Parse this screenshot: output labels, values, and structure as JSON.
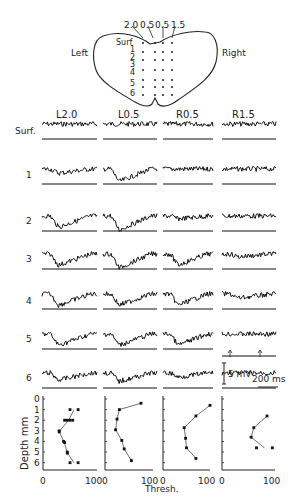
{
  "schematic": {
    "left_label": "Left",
    "right_label": "Right",
    "electrode_labels": [
      "2.0",
      "0.5",
      "0.5",
      "1.5"
    ],
    "depth_labels": [
      "Surf",
      "1",
      "2",
      "3",
      "4",
      "5",
      "6"
    ]
  },
  "traces": {
    "column_headers": [
      "L2.0",
      "L0.5",
      "R0.5",
      "R1.5"
    ],
    "row_labels": [
      "Surf.",
      "1",
      "2",
      "3",
      "4",
      "5",
      "6"
    ],
    "scale_bar_voltage": "5 mV",
    "scale_bar_time": "200 ms"
  },
  "plots": {
    "ylabel": "Depth mm",
    "xlabel": "Thresh.",
    "y_ticks": [
      "0",
      "1",
      "2",
      "3",
      "4",
      "5",
      "6"
    ],
    "x_ticks": [
      "0",
      "100"
    ]
  },
  "chart_data": {
    "type": "scatter",
    "title": "",
    "xlabel": "Thresh.",
    "ylabel": "Depth mm",
    "xlim": [
      0,
      100
    ],
    "ylim": [
      6.7,
      0
    ],
    "series": [
      {
        "name": "L2.0",
        "points": [
          [
            50,
            1
          ],
          [
            65,
            1
          ],
          [
            40,
            2
          ],
          [
            45,
            2
          ],
          [
            50,
            2
          ],
          [
            55,
            2
          ],
          [
            30,
            3
          ],
          [
            30,
            3.1
          ],
          [
            38,
            4
          ],
          [
            40,
            4.1
          ],
          [
            45,
            5
          ],
          [
            45,
            5.1
          ],
          [
            50,
            6
          ],
          [
            65,
            6
          ]
        ]
      },
      {
        "name": "L0.5",
        "points": [
          [
            75,
            0.4
          ],
          [
            30,
            1
          ],
          [
            25,
            1.9
          ],
          [
            22,
            2.9
          ],
          [
            35,
            3.9
          ],
          [
            40,
            4.7
          ],
          [
            55,
            5.8
          ]
        ]
      },
      {
        "name": "R0.5",
        "points": [
          [
            100,
            0.6
          ],
          [
            70,
            1.6
          ],
          [
            45,
            2.7
          ],
          [
            48,
            3.7
          ],
          [
            50,
            4.6
          ],
          [
            70,
            5.6
          ]
        ]
      },
      {
        "name": "R1.5",
        "points": [
          [
            85,
            1.6
          ],
          [
            60,
            2.7
          ],
          [
            55,
            3.6
          ],
          [
            95,
            4.6
          ],
          [
            65,
            4.6
          ]
        ]
      }
    ]
  }
}
